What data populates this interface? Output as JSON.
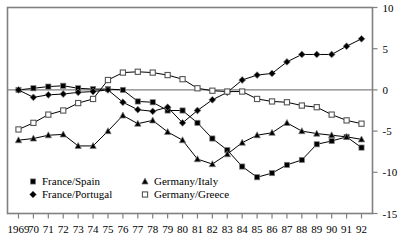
{
  "chart_data": {
    "type": "line",
    "title": "",
    "subtitle": "",
    "xlabel": "",
    "ylabel": "",
    "xlim": [
      1969,
      1992
    ],
    "ylim": [
      -15,
      10
    ],
    "yticks": [
      10,
      5,
      0,
      -5,
      -10,
      -15
    ],
    "ytick_labels": [
      "10",
      "5",
      "0",
      "-5",
      "-10",
      "-15"
    ],
    "grid": false,
    "zero_line": true,
    "legend_position": "inside-bottom-left",
    "x": [
      1969,
      1970,
      1971,
      1972,
      1973,
      1974,
      1975,
      1976,
      1977,
      1978,
      1979,
      1980,
      1981,
      1982,
      1983,
      1984,
      1985,
      1986,
      1987,
      1988,
      1989,
      1990,
      1991,
      1992
    ],
    "xtick_labels": [
      "1969",
      "70",
      "71",
      "72",
      "73",
      "74",
      "75",
      "76",
      "77",
      "78",
      "79",
      "80",
      "81",
      "82",
      "83",
      "84",
      "85",
      "86",
      "87",
      "88",
      "89",
      "90",
      "91",
      "92"
    ],
    "series": [
      {
        "name": "France/Spain",
        "marker": "filled-square",
        "color": "#000000",
        "values": [
          0.0,
          0.2,
          0.4,
          0.5,
          0.2,
          0.1,
          0.1,
          0.0,
          -1.4,
          -1.5,
          -2.5,
          -2.5,
          -4.0,
          -5.9,
          -7.3,
          -9.3,
          -10.6,
          -10.1,
          -9.1,
          -8.5,
          -6.6,
          -6.2,
          -5.7,
          -7.0
        ]
      },
      {
        "name": "France/Portugal",
        "marker": "filled-diamond",
        "color": "#000000",
        "values": [
          0.0,
          -0.9,
          -0.6,
          -0.5,
          -0.3,
          -0.2,
          0.0,
          -1.5,
          -2.4,
          -2.6,
          -2.1,
          -4.0,
          -2.5,
          -1.2,
          -0.3,
          1.2,
          1.8,
          2.0,
          3.4,
          4.3,
          4.3,
          4.3,
          5.3,
          6.2
        ]
      },
      {
        "name": "Germany/Italy",
        "marker": "filled-triangle",
        "color": "#000000",
        "values": [
          -6.1,
          -5.9,
          -5.5,
          -5.4,
          -6.8,
          -6.8,
          -5.0,
          -3.1,
          -4.1,
          -3.7,
          -5.1,
          -6.1,
          -8.4,
          -9.0,
          -7.8,
          -6.4,
          -5.5,
          -5.2,
          -4.0,
          -5.0,
          -5.3,
          -5.5,
          -5.7,
          -6.0
        ]
      },
      {
        "name": "Germany/Greece",
        "marker": "open-square",
        "color": "#000000",
        "values": [
          -4.8,
          -4.0,
          -3.0,
          -2.5,
          -1.6,
          -1.1,
          1.2,
          2.1,
          2.2,
          2.1,
          1.8,
          1.3,
          0.2,
          -0.1,
          -0.2,
          -0.2,
          -1.1,
          -1.4,
          -1.5,
          -1.9,
          -2.1,
          -3.0,
          -3.7,
          -4.1
        ]
      }
    ]
  },
  "legend": {
    "items": [
      {
        "label": "France/Spain",
        "marker": "filled-square"
      },
      {
        "label": "France/Portugal",
        "marker": "filled-diamond"
      },
      {
        "label": "Germany/Italy",
        "marker": "filled-triangle"
      },
      {
        "label": "Germany/Greece",
        "marker": "open-square"
      }
    ]
  },
  "colors": {
    "ink": "#000000",
    "frame": "#808080",
    "marker_edge": "#808080",
    "background": "#ffffff"
  }
}
